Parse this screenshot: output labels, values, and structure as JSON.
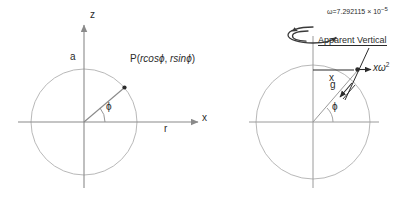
{
  "figure": {
    "type": "physics-diagram"
  },
  "colors": {
    "stroke_dark": "#2b2b2b",
    "stroke_light": "#9a9a9a",
    "stroke_axis": "#8a8a8a",
    "background": "#ffffff"
  },
  "left_diagram": {
    "name": "polar-coordinate-diagram",
    "axis_z_label": "z",
    "axis_x_label": "x",
    "radius_label": "a",
    "radial_axis_label": "r",
    "angle_label": "ϕ",
    "point_label": "P(",
    "point_expr_cos": "rcos",
    "point_phi_1": "ϕ",
    "point_comma": ", ",
    "point_expr_sin": "rsin",
    "point_phi_2": "ϕ",
    "point_close": ")"
  },
  "right_diagram": {
    "name": "apparent-vertical-diagram",
    "omega_symbol": "ω",
    "omega_equals": "=7.292115 × 10",
    "omega_exponent": "−5",
    "apparent_vertical_label": "Apparent Vertical",
    "x_label": "x",
    "g_label": "g",
    "centrifugal_label": "xω",
    "centrifugal_exponent": "2",
    "angle_label": "ϕ"
  }
}
